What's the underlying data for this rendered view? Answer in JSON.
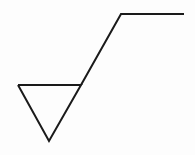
{
  "diagram": {
    "type": "surface-texture-symbol",
    "stroke_color": "#1a1a1a",
    "background_color": "#fdfdfd",
    "stroke_width": 2,
    "triangle": {
      "top_left": [
        18,
        85
      ],
      "top_right": [
        81,
        85
      ],
      "apex": [
        49,
        141
      ]
    },
    "long_leg": {
      "from": [
        81,
        85
      ],
      "to": [
        121,
        14
      ]
    },
    "horizontal_bar": {
      "from": [
        121,
        14
      ],
      "to": [
        184,
        14
      ]
    }
  }
}
